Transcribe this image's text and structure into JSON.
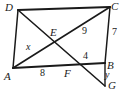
{
  "figure": {
    "stroke_color": "#1a1a1a",
    "background_color": "#ffffff",
    "vertices": [
      {
        "name": "D",
        "label": "D",
        "x": 18,
        "y": 10
      },
      {
        "name": "C",
        "label": "C",
        "x": 110,
        "y": 7
      },
      {
        "name": "A",
        "label": "A",
        "x": 13,
        "y": 68
      },
      {
        "name": "B",
        "label": "B",
        "x": 105,
        "y": 63
      },
      {
        "name": "E",
        "label": "E",
        "x": 57,
        "y": 38
      },
      {
        "name": "F",
        "label": "F",
        "x": 71,
        "y": 66
      },
      {
        "name": "G",
        "label": "G",
        "x": 105,
        "y": 86
      }
    ],
    "segments": [
      {
        "name": "segment-DC",
        "from": "D",
        "to": "C"
      },
      {
        "name": "segment-DA",
        "from": "D",
        "to": "A"
      },
      {
        "name": "segment-AB",
        "from": "A",
        "to": "B"
      },
      {
        "name": "segment-BC",
        "from": "B",
        "to": "C"
      },
      {
        "name": "segment-AC-diagonal",
        "from": "A",
        "to": "C"
      },
      {
        "name": "segment-DG-transversal",
        "from": "D",
        "to": "G"
      },
      {
        "name": "segment-BG",
        "from": "B",
        "to": "G"
      }
    ],
    "measures": [
      {
        "name": "measure-AE",
        "label": "x",
        "on": "AE",
        "italic": true
      },
      {
        "name": "measure-EC",
        "label": "9",
        "on": "EC",
        "italic": false
      },
      {
        "name": "measure-AF",
        "label": "8",
        "on": "AF",
        "italic": false
      },
      {
        "name": "measure-FB",
        "label": "4",
        "on": "FB",
        "italic": false
      },
      {
        "name": "measure-BC",
        "label": "7",
        "on": "BC",
        "italic": false
      },
      {
        "name": "measure-BG",
        "label": "y",
        "on": "BG",
        "italic": true
      }
    ]
  }
}
